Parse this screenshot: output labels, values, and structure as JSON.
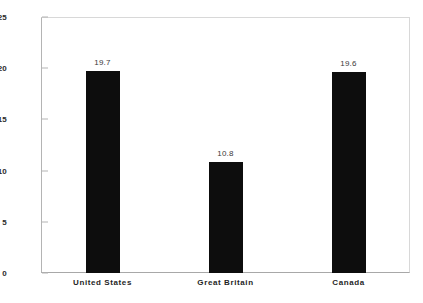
{
  "chart_data": {
    "type": "bar",
    "title": "",
    "subtitle": "",
    "xlabel": "",
    "ylabel": "",
    "categories": [
      "United States",
      "Great Britain",
      "Canada"
    ],
    "values": [
      19.7,
      10.8,
      19.6
    ],
    "value_labels": [
      "19.7",
      "10.8",
      "19.6"
    ],
    "ylim": [
      0,
      25
    ],
    "ytick_labels": [
      "0",
      "5",
      "10",
      "15",
      "20",
      "25"
    ],
    "ytick_values": [
      0,
      5,
      10,
      15,
      20,
      25
    ],
    "grid": false,
    "legend": null,
    "legend_position": "none",
    "bar_color": "#0d0d0d",
    "background_color": "#ffffff",
    "axis_color": "#b4b4b4",
    "label_color": "#1f1f1f"
  }
}
